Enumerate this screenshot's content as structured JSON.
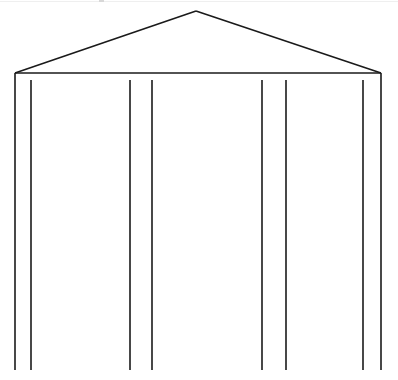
{
  "canvas": {
    "width": 398,
    "height": 380,
    "background_color": "#ffffff",
    "stroke_color": "#1a1a1a",
    "stroke_width": 1.6,
    "title": "Gable building facade line drawing"
  },
  "artifact": {
    "name": "top-edge-scan-line",
    "color": "#efefef",
    "mark_color": "#d8d8d8"
  },
  "chart_data": {
    "type": "line",
    "subtitle": "",
    "xlabel": "",
    "ylabel": "",
    "xlim": [
      0,
      398
    ],
    "ylim": [
      0,
      380
    ],
    "grid": false,
    "legend": "none",
    "annotations": [],
    "tick_labels": {
      "x": [],
      "y": []
    },
    "points_of_interest": {
      "roof_apex": [
        196,
        11
      ],
      "eave_left": [
        15,
        73
      ],
      "eave_right": [
        381,
        73
      ],
      "baseline_y": 370
    },
    "series": [
      {
        "name": "roof-left-slope",
        "points": [
          [
            15,
            73
          ],
          [
            196,
            11
          ]
        ]
      },
      {
        "name": "roof-right-slope",
        "points": [
          [
            196,
            11
          ],
          [
            381,
            73
          ]
        ]
      },
      {
        "name": "eave-horizontal",
        "points": [
          [
            15,
            73
          ],
          [
            381,
            73
          ]
        ]
      },
      {
        "name": "post-1",
        "points": [
          [
            15,
            73
          ],
          [
            15,
            370
          ]
        ]
      },
      {
        "name": "post-2",
        "points": [
          [
            31,
            80
          ],
          [
            31,
            370
          ]
        ]
      },
      {
        "name": "post-3",
        "points": [
          [
            130,
            80
          ],
          [
            130,
            370
          ]
        ]
      },
      {
        "name": "post-4",
        "points": [
          [
            152,
            80
          ],
          [
            152,
            370
          ]
        ]
      },
      {
        "name": "post-5",
        "points": [
          [
            262,
            80
          ],
          [
            262,
            370
          ]
        ]
      },
      {
        "name": "post-6",
        "points": [
          [
            286,
            80
          ],
          [
            286,
            370
          ]
        ]
      },
      {
        "name": "post-7",
        "points": [
          [
            363,
            80
          ],
          [
            363,
            370
          ]
        ]
      },
      {
        "name": "post-8",
        "points": [
          [
            381,
            73
          ],
          [
            381,
            370
          ]
        ]
      }
    ]
  }
}
